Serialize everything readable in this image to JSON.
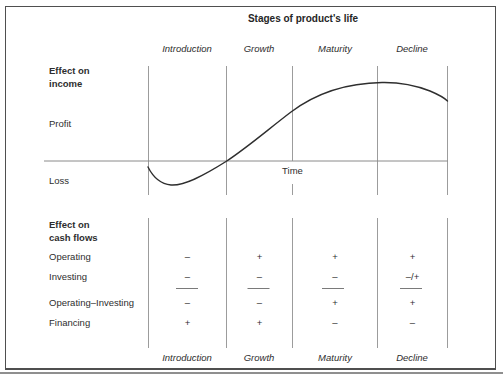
{
  "figure": {
    "title": "Stages of product's life",
    "stages": [
      "Introduction",
      "Growth",
      "Maturity",
      "Decline"
    ],
    "income_section": {
      "label": "Effect on income",
      "profit_label": "Profit",
      "loss_label": "Loss",
      "time_label": "Time",
      "curve_description": "Income is negative (loss) during Introduction, crosses into profit at the start of Growth, peaks during Maturity, and falls during Decline."
    },
    "cashflow_section": {
      "label": "Effect on cash flows",
      "rows": [
        {
          "label": "Operating",
          "values": [
            "–",
            "+",
            "+",
            "+"
          ]
        },
        {
          "label": "Investing",
          "values": [
            "–",
            "–",
            "–",
            "–/+"
          ]
        },
        {
          "label": "Operating–Investing",
          "values": [
            "–",
            "–",
            "+",
            "+"
          ]
        },
        {
          "label": "Financing",
          "values": [
            "+",
            "+",
            "–",
            "–"
          ]
        }
      ]
    },
    "colors": {
      "divider_gray": "#9c9c9c",
      "axis_gray": "#8a8a8a",
      "curve_black": "#2e2e2e",
      "text": "#2b2b2b",
      "border": "#4f4f4f"
    }
  }
}
